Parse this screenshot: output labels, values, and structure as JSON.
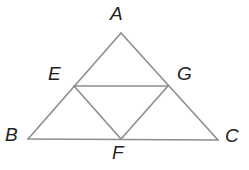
{
  "figure": {
    "kind": "geometry-diagram",
    "canvas": {
      "width": 249,
      "height": 170,
      "background": "#ffffff"
    },
    "style": {
      "stroke_color": "#8d8d8d",
      "stroke_width": 1.6,
      "label_color": "#222222",
      "label_font_size": 19
    },
    "points": [
      {
        "id": "A",
        "label": "A",
        "x": 121,
        "y": 33,
        "label_x": 110,
        "label_y": 4
      },
      {
        "id": "B",
        "label": "B",
        "x": 28,
        "y": 139,
        "label_x": 5,
        "label_y": 125
      },
      {
        "id": "C",
        "label": "C",
        "x": 218,
        "y": 140,
        "label_x": 225,
        "label_y": 126
      },
      {
        "id": "E",
        "label": "E",
        "x": 74,
        "y": 86,
        "label_x": 48,
        "label_y": 64
      },
      {
        "id": "G",
        "label": "G",
        "x": 168,
        "y": 86,
        "label_x": 177,
        "label_y": 64
      },
      {
        "id": "F",
        "label": "F",
        "x": 121,
        "y": 139,
        "label_x": 112,
        "label_y": 143
      }
    ],
    "segments": [
      {
        "id": "AB",
        "from": "A",
        "to": "B",
        "path": "M 121 33 L 28 139"
      },
      {
        "id": "AC",
        "from": "A",
        "to": "C",
        "path": "M 121 33 L 218 140"
      },
      {
        "id": "BC",
        "from": "B",
        "to": "C",
        "path": "M 28 139 L 218 140"
      },
      {
        "id": "EG",
        "from": "E",
        "to": "G",
        "path": "M 74 86 L 168 86"
      },
      {
        "id": "EF",
        "from": "E",
        "to": "F",
        "path": "M 74 86 L 121 139"
      },
      {
        "id": "GF",
        "from": "G",
        "to": "F",
        "path": "M 168 86 L 121 139"
      }
    ]
  }
}
